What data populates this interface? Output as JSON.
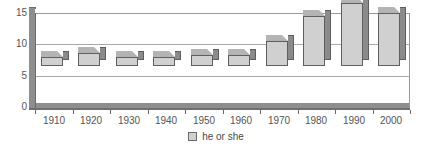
{
  "chart_data": {
    "type": "bar",
    "title": "",
    "xlabel": "",
    "ylabel": "",
    "categories": [
      "1910",
      "1920",
      "1930",
      "1940",
      "1950",
      "1960",
      "1970",
      "1980",
      "1990",
      "2000"
    ],
    "series": [
      {
        "name": "he or she",
        "values": [
          1.4,
          2.0,
          1.4,
          1.5,
          1.7,
          1.8,
          4.0,
          8.0,
          10.0,
          8.5
        ]
      }
    ],
    "ylim": [
      0,
      15
    ],
    "yticks": [
      0,
      5,
      10,
      15
    ],
    "ytick_labels": [
      "0",
      "5",
      "10",
      "15"
    ],
    "grid": true,
    "grid_axis": "y",
    "legend": {
      "position": "bottom",
      "entries": [
        {
          "label": "he or she",
          "color": "#d0d0d0"
        }
      ]
    },
    "style": {
      "three_d": true,
      "bar_face_color": "#d0d0d0",
      "bar_side_color": "#8b8b8b",
      "bar_top_color": "#b4b4b4",
      "bar_edge_color": "#5f5f5f",
      "grid_color": "#a8a8a8",
      "axis_color": "#6b6b6b",
      "wall_color": "#8e8e8e",
      "text_color": "#555555",
      "background": "#ffffff"
    }
  }
}
